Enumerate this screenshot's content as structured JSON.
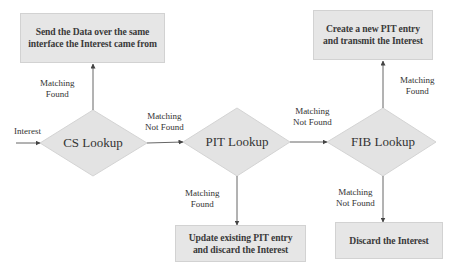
{
  "diagram": {
    "type": "flowchart",
    "input_label": "Interest",
    "nodes": {
      "cs": {
        "label": "CS Lookup",
        "shape": "diamond"
      },
      "pit": {
        "label": "PIT Lookup",
        "shape": "diamond"
      },
      "fib": {
        "label": "FIB Lookup",
        "shape": "diamond"
      },
      "send_data": {
        "line1": "Send the Data over the same",
        "line2": "interface the Interest came from",
        "shape": "box"
      },
      "create_pit": {
        "line1": "Create a new PIT entry",
        "line2": "and transmit the Interest",
        "shape": "box"
      },
      "update_pit": {
        "line1": "Update existing PIT entry",
        "line2": "and discard the Interest",
        "shape": "box"
      },
      "discard": {
        "line1": "Discard the Interest",
        "shape": "box"
      }
    },
    "edges": {
      "cs_to_send": {
        "line1": "Matching",
        "line2": "Found"
      },
      "cs_to_pit": {
        "line1": "Matching",
        "line2": "Not Found"
      },
      "pit_to_update": {
        "line1": "Matching",
        "line2": "Found"
      },
      "pit_to_fib": {
        "line1": "Matching",
        "line2": "Not Found"
      },
      "fib_to_create": {
        "line1": "Matching",
        "line2": "Found"
      },
      "fib_to_discard": {
        "line1": "Matching",
        "line2": "Not Found"
      }
    },
    "colors": {
      "shape_fill": "#e6e6e6",
      "shape_border": "#d2d2d2",
      "line": "#666666",
      "text": "#333333"
    }
  }
}
